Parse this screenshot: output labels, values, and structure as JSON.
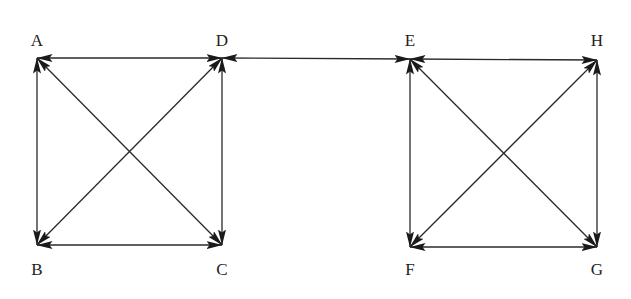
{
  "diagram": {
    "type": "directed-graph",
    "edge_style": "bidirectional-arrows",
    "colors": {
      "stroke": "#2a2a2a",
      "label": "#222222",
      "background": "#ffffff"
    },
    "nodes": [
      {
        "id": "A",
        "label": "A",
        "x": 37,
        "y": 58,
        "label_x": 37,
        "label_y": 46
      },
      {
        "id": "D",
        "label": "D",
        "x": 222,
        "y": 58,
        "label_x": 222,
        "label_y": 46
      },
      {
        "id": "B",
        "label": "B",
        "x": 37,
        "y": 245,
        "label_x": 37,
        "label_y": 275
      },
      {
        "id": "C",
        "label": "C",
        "x": 222,
        "y": 245,
        "label_x": 222,
        "label_y": 275
      },
      {
        "id": "E",
        "label": "E",
        "x": 410,
        "y": 59,
        "label_x": 410,
        "label_y": 46
      },
      {
        "id": "H",
        "label": "H",
        "x": 597,
        "y": 60,
        "label_x": 597,
        "label_y": 46
      },
      {
        "id": "F",
        "label": "F",
        "x": 410,
        "y": 247,
        "label_x": 410,
        "label_y": 275
      },
      {
        "id": "G",
        "label": "G",
        "x": 597,
        "y": 247,
        "label_x": 597,
        "label_y": 275
      }
    ],
    "edges": [
      {
        "from": "A",
        "to": "D",
        "bidirectional": true
      },
      {
        "from": "A",
        "to": "B",
        "bidirectional": true
      },
      {
        "from": "A",
        "to": "C",
        "bidirectional": true
      },
      {
        "from": "D",
        "to": "B",
        "bidirectional": true
      },
      {
        "from": "D",
        "to": "C",
        "bidirectional": true
      },
      {
        "from": "B",
        "to": "C",
        "bidirectional": true
      },
      {
        "from": "D",
        "to": "E",
        "bidirectional": true
      },
      {
        "from": "E",
        "to": "H",
        "bidirectional": true
      },
      {
        "from": "E",
        "to": "F",
        "bidirectional": true
      },
      {
        "from": "E",
        "to": "G",
        "bidirectional": true
      },
      {
        "from": "H",
        "to": "F",
        "bidirectional": true
      },
      {
        "from": "H",
        "to": "G",
        "bidirectional": true
      },
      {
        "from": "F",
        "to": "G",
        "bidirectional": true
      }
    ]
  }
}
